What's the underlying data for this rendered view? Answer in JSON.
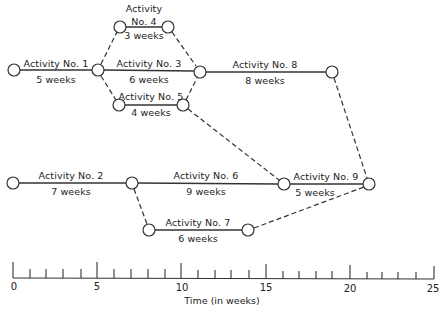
{
  "diagram": {
    "type": "network (PERT/CPM activity-on-arrow)",
    "activities": [
      {
        "id": 1,
        "name": "Activity No. 1",
        "duration": "5 weeks"
      },
      {
        "id": 2,
        "name": "Activity No. 2",
        "duration": "7 weeks"
      },
      {
        "id": 3,
        "name": "Activity No. 3",
        "duration": "6 weeks"
      },
      {
        "id": 4,
        "name_line1": "Activity",
        "name_line2": "No. 4",
        "name": "Activity No. 4",
        "duration": "3 weeks"
      },
      {
        "id": 5,
        "name": "Activity No. 5",
        "duration": "4 weeks"
      },
      {
        "id": 6,
        "name": "Activity No. 6",
        "duration": "9 weeks"
      },
      {
        "id": 7,
        "name": "Activity No. 7",
        "duration": "6 weeks"
      },
      {
        "id": 8,
        "name": "Activity No. 8",
        "duration": "8 weeks"
      },
      {
        "id": 9,
        "name": "Activity No. 9",
        "duration": "5 weeks"
      }
    ],
    "dependencies": [
      {
        "from": 1,
        "to": 3,
        "style": "solid"
      },
      {
        "from": 1,
        "to": 4,
        "style": "dashed"
      },
      {
        "from": 1,
        "to": 5,
        "style": "dashed"
      },
      {
        "from": 4,
        "to": 8,
        "style": "dashed"
      },
      {
        "from": 3,
        "to": 8,
        "style": "solid"
      },
      {
        "from": 5,
        "to": 8,
        "style": "dashed"
      },
      {
        "from": 5,
        "to": 9,
        "style": "dashed"
      },
      {
        "from": 2,
        "to": 6,
        "style": "solid"
      },
      {
        "from": 2,
        "to": 7,
        "style": "dashed"
      },
      {
        "from": 6,
        "to": 9,
        "style": "solid"
      },
      {
        "from": 7,
        "to": 9,
        "style": "dashed"
      },
      {
        "from": 8,
        "to": 9,
        "style": "dashed"
      }
    ]
  },
  "axis": {
    "title": "Time (in weeks)",
    "min": 0,
    "max": 25,
    "major_ticks": [
      "0",
      "5",
      "10",
      "15",
      "20",
      "25"
    ],
    "minor_step": 1
  },
  "colors": {
    "line": "#333333",
    "node_fill": "#ffffff",
    "text": "#222222"
  }
}
